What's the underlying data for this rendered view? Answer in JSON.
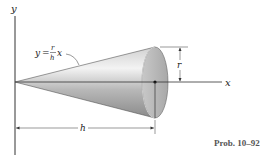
{
  "figure": {
    "type": "cone-diagram",
    "axes": {
      "x_label": "x",
      "y_label": "y"
    },
    "equation": {
      "lhs": "y",
      "equals": "=",
      "numerator": "r",
      "denominator": "h",
      "variable": "x"
    },
    "dimensions": {
      "radius_label": "r",
      "height_label": "h"
    },
    "caption": "Prob. 10–92",
    "colors": {
      "line": "#333333",
      "cone_light": "#f2f2f2",
      "cone_dark": "#8c8c8c",
      "base_face": "#b5b5b5",
      "caption": "#555555"
    }
  }
}
